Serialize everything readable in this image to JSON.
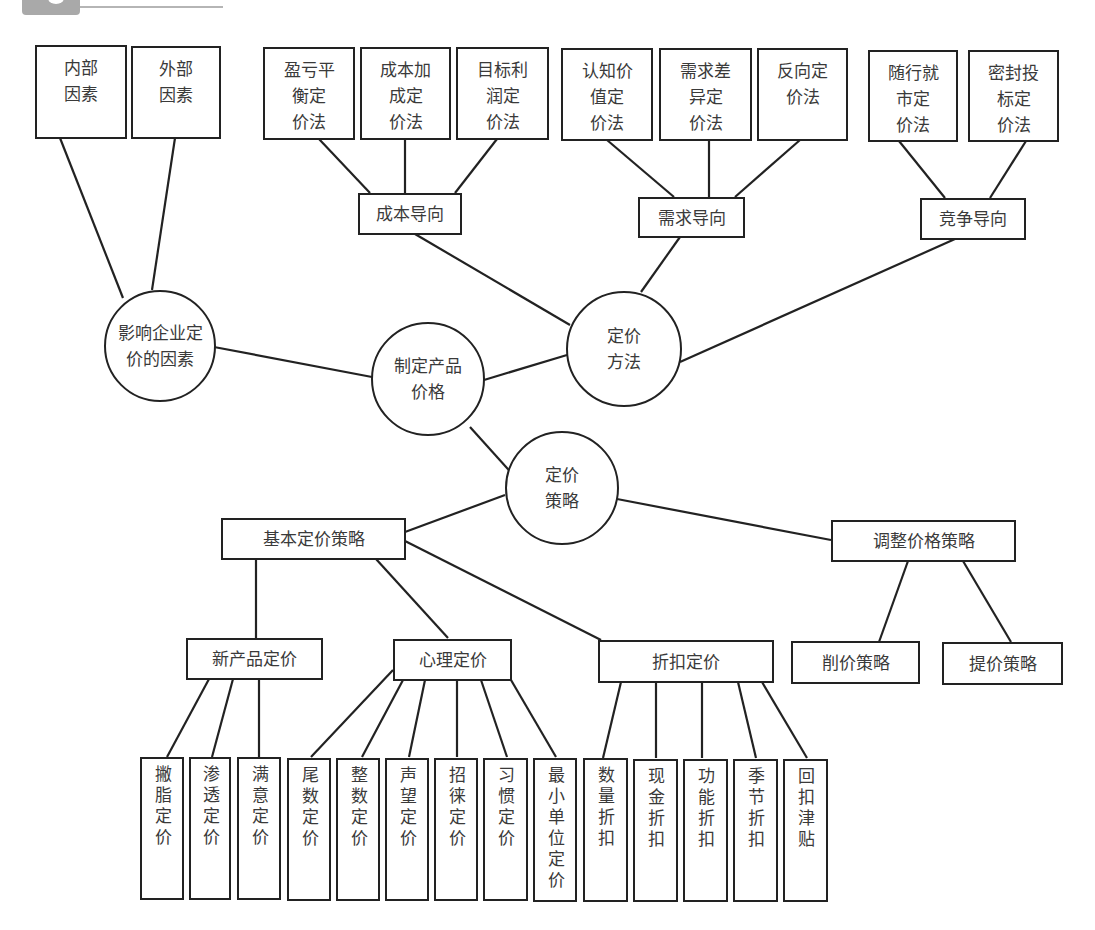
{
  "diagram": {
    "center": {
      "label": "制定产品\n价格"
    },
    "factors": {
      "label": "影响企业定\n价的因素",
      "children": [
        {
          "label": "内部\n因素"
        },
        {
          "label": "外部\n因素"
        }
      ]
    },
    "methods": {
      "label": "定价\n方法",
      "groups": [
        {
          "label": "成本导向",
          "children": [
            {
              "label": "盈亏平\n衡定\n价法"
            },
            {
              "label": "成本加\n成定\n价法"
            },
            {
              "label": "目标利\n润定\n价法"
            }
          ]
        },
        {
          "label": "需求导向",
          "children": [
            {
              "label": "认知价\n值定\n价法"
            },
            {
              "label": "需求差\n异定\n价法"
            },
            {
              "label": "反向定\n价法"
            }
          ]
        },
        {
          "label": "竞争导向",
          "children": [
            {
              "label": "随行就\n市定\n价法"
            },
            {
              "label": "密封投\n标定\n价法"
            }
          ]
        }
      ]
    },
    "strategies": {
      "label": "定价\n策略",
      "basic": {
        "label": "基本定价策略",
        "groups": [
          {
            "label": "新产品定价",
            "children": [
              {
                "label": "撇脂定价"
              },
              {
                "label": "渗透定价"
              },
              {
                "label": "满意定价"
              }
            ]
          },
          {
            "label": "心理定价",
            "children": [
              {
                "label": "尾数定价"
              },
              {
                "label": "整数定价"
              },
              {
                "label": "声望定价"
              },
              {
                "label": "招徕定价"
              },
              {
                "label": "习惯定价"
              },
              {
                "label": "最小单位定价"
              }
            ]
          },
          {
            "label": "折扣定价",
            "children": [
              {
                "label": "数量折扣"
              },
              {
                "label": "现金折扣"
              },
              {
                "label": "功能折扣"
              },
              {
                "label": "季节折扣"
              },
              {
                "label": "回扣津贴"
              }
            ]
          }
        ]
      },
      "adjust": {
        "label": "调整价格策略",
        "children": [
          {
            "label": "削价策略"
          },
          {
            "label": "提价策略"
          }
        ]
      }
    }
  },
  "colors": {
    "line": "#222222",
    "text": "#3a3a3a",
    "header_tab": "#a9a9a9"
  }
}
